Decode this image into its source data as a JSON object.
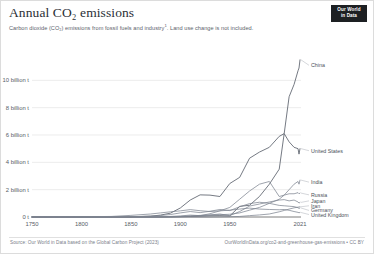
{
  "header": {
    "title": "Annual CO₂ emissions",
    "subtitle": "Carbon dioxide (CO₂) emissions from fossil fuels and industry",
    "subtitle_footnote": "1",
    "subtitle_tail": ". Land use change is not included.",
    "logo_line1": "Our World",
    "logo_line2": "in Data"
  },
  "footer": {
    "source": "Source: Our World in Data based on the Global Carbon Project (2023)",
    "url": "OurWorldInData.org/co2-and-greenhouse-gas-emissions • CC BY"
  },
  "colors": {
    "line": "#7e8490",
    "grid": "#e4e4e4",
    "axis": "#5b5b5b",
    "text": "#575d66",
    "logo_bg": "#1d2023"
  },
  "chart_data": {
    "type": "line",
    "title": "Annual CO₂ emissions",
    "subtitle": "Carbon dioxide (CO₂) emissions from fossil fuels and industry. Land use change is not included.",
    "xlabel": "",
    "ylabel": "",
    "unit": "tonnes of CO₂ per year",
    "grid": true,
    "legend_position": "right-inline-labels",
    "xlim": [
      1750,
      2021
    ],
    "ylim": [
      0,
      12000000000
    ],
    "xticks": [
      1750,
      1800,
      1850,
      1900,
      1950,
      2021
    ],
    "xticklabels": [
      "1750",
      "1800",
      "1850",
      "1900",
      "1950",
      "2021"
    ],
    "yticks": [
      0,
      2000000000,
      4000000000,
      6000000000,
      8000000000,
      10000000000
    ],
    "yticklabels": [
      "0 t",
      "2 billion t",
      "4 billion t",
      "6 billion t",
      "8 billion t",
      "10 billion t"
    ],
    "x": [
      1750,
      1800,
      1830,
      1850,
      1870,
      1880,
      1890,
      1900,
      1910,
      1920,
      1930,
      1940,
      1950,
      1960,
      1970,
      1980,
      1990,
      2000,
      2005,
      2010,
      2015,
      2019,
      2020,
      2021
    ],
    "series": [
      {
        "name": "China",
        "label": "China",
        "values_billion_t": [
          0.0,
          0.0,
          0.0,
          0.0,
          0.0,
          0.0,
          0.01,
          0.02,
          0.04,
          0.06,
          0.09,
          0.1,
          0.08,
          0.78,
          0.86,
          1.5,
          2.4,
          3.5,
          6.1,
          8.8,
          9.7,
          10.7,
          10.9,
          11.5
        ],
        "end_value_billion_t": 11.5,
        "label_y_billion_t": 11.1
      },
      {
        "name": "United States",
        "label": "United States",
        "values_billion_t": [
          0.0,
          0.0,
          0.0,
          0.01,
          0.06,
          0.14,
          0.28,
          0.66,
          1.24,
          1.62,
          1.6,
          1.5,
          2.45,
          2.9,
          4.3,
          4.75,
          5.1,
          5.9,
          6.1,
          5.5,
          5.1,
          5.0,
          4.6,
          5.0
        ],
        "end_value_billion_t": 5.0,
        "label_y_billion_t": 4.85
      },
      {
        "name": "India",
        "label": "India",
        "values_billion_t": [
          0.0,
          0.0,
          0.0,
          0.0,
          0.0,
          0.01,
          0.02,
          0.04,
          0.07,
          0.1,
          0.14,
          0.17,
          0.2,
          0.3,
          0.5,
          0.7,
          1.0,
          1.3,
          1.6,
          2.0,
          2.4,
          2.6,
          2.4,
          2.7
        ],
        "end_value_billion_t": 2.7,
        "label_y_billion_t": 2.55
      },
      {
        "name": "Russia",
        "label": "Russia",
        "values_billion_t": [
          0.0,
          0.0,
          0.0,
          0.0,
          0.01,
          0.02,
          0.04,
          0.08,
          0.14,
          0.1,
          0.24,
          0.45,
          0.7,
          1.3,
          1.9,
          2.4,
          2.6,
          1.5,
          1.6,
          1.7,
          1.7,
          1.78,
          1.7,
          1.75
        ],
        "end_value_billion_t": 1.75,
        "label_y_billion_t": 1.62
      },
      {
        "name": "Japan",
        "label": "Japan",
        "values_billion_t": [
          0.0,
          0.0,
          0.0,
          0.0,
          0.0,
          0.0,
          0.01,
          0.03,
          0.07,
          0.12,
          0.15,
          0.22,
          0.1,
          0.4,
          0.8,
          0.95,
          1.1,
          1.24,
          1.27,
          1.18,
          1.24,
          1.1,
          1.02,
          1.07
        ],
        "end_value_billion_t": 1.07,
        "label_y_billion_t": 1.18
      },
      {
        "name": "Iran",
        "label": "Iran",
        "values_billion_t": [
          0.0,
          0.0,
          0.0,
          0.0,
          0.0,
          0.0,
          0.0,
          0.0,
          0.0,
          0.0,
          0.0,
          0.01,
          0.02,
          0.04,
          0.1,
          0.15,
          0.22,
          0.38,
          0.48,
          0.58,
          0.67,
          0.72,
          0.73,
          0.75
        ],
        "end_value_billion_t": 0.75,
        "label_y_billion_t": 0.82
      },
      {
        "name": "Germany",
        "label": "Germany",
        "values_billion_t": [
          0.0,
          0.0,
          0.01,
          0.02,
          0.07,
          0.11,
          0.18,
          0.3,
          0.4,
          0.32,
          0.42,
          0.55,
          0.47,
          0.75,
          0.98,
          1.08,
          1.0,
          0.85,
          0.82,
          0.79,
          0.76,
          0.68,
          0.62,
          0.66
        ],
        "end_value_billion_t": 0.66,
        "label_y_billion_t": 0.48
      },
      {
        "name": "United Kingdom",
        "label": "United Kingdom",
        "values_billion_t": [
          0.01,
          0.02,
          0.04,
          0.12,
          0.22,
          0.3,
          0.38,
          0.45,
          0.54,
          0.46,
          0.4,
          0.45,
          0.5,
          0.58,
          0.65,
          0.58,
          0.55,
          0.53,
          0.55,
          0.49,
          0.4,
          0.34,
          0.31,
          0.33
        ],
        "end_value_billion_t": 0.33,
        "label_y_billion_t": 0.18
      }
    ]
  }
}
